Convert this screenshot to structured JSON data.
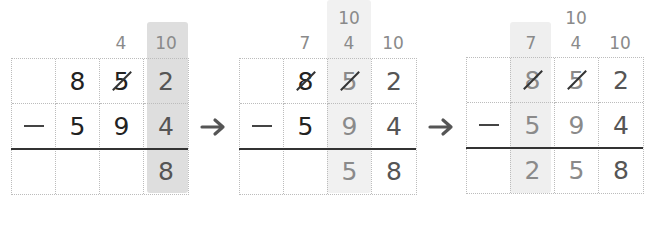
{
  "panels": [
    {
      "id": "step-1",
      "carries": {
        "col3": "4",
        "col4": "10"
      },
      "rows": {
        "top": [
          "",
          "8",
          "5",
          "2"
        ],
        "subtract": [
          "−",
          "5",
          "9",
          "4"
        ],
        "result": [
          "",
          "",
          "",
          "8"
        ]
      },
      "struck": [
        "top.col3"
      ],
      "highlight_column": 4
    },
    {
      "id": "step-2",
      "carries": {
        "col2": "7",
        "col3_upper": "10",
        "col3": "4",
        "col4": "10"
      },
      "rows": {
        "top": [
          "",
          "8",
          "5",
          "2"
        ],
        "subtract": [
          "−",
          "5",
          "9",
          "4"
        ],
        "result": [
          "",
          "",
          "5",
          "8"
        ]
      },
      "struck": [
        "top.col2",
        "top.col3"
      ],
      "highlight_column": 3
    },
    {
      "id": "step-3",
      "carries": {
        "col2": "7",
        "col3_upper": "10",
        "col3": "4",
        "col4": "10"
      },
      "rows": {
        "top": [
          "",
          "8",
          "5",
          "2"
        ],
        "subtract": [
          "−",
          "5",
          "9",
          "4"
        ],
        "result": [
          "",
          "2",
          "5",
          "8"
        ]
      },
      "struck": [
        "top.col2",
        "top.col3"
      ],
      "highlight_column": 2
    }
  ],
  "arrows": [
    "right-arrow",
    "right-arrow"
  ],
  "colors": {
    "highlight_strong": "#dedede",
    "highlight_light": "#f1f1f1",
    "digit_dark": "#222222",
    "digit_gray": "#8a8a8a",
    "grid_dotted": "#bcbcbc",
    "arrow": "#555555"
  }
}
